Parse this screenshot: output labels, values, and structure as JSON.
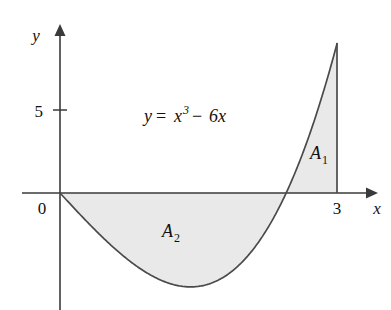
{
  "figure": {
    "equation": {
      "lhs": "y",
      "equals": "=",
      "base": "x",
      "exponent": "3",
      "minus": "−",
      "term": "6x",
      "full": "y = x³ − 6x"
    },
    "axes": {
      "x_label": "x",
      "y_label": "y",
      "x_ticks": [
        {
          "value": 3,
          "label": "3"
        }
      ],
      "y_ticks": [
        {
          "value": 5,
          "label": "5"
        }
      ],
      "origin_label": "0"
    },
    "regions": [
      {
        "id": "A1",
        "letter": "A",
        "subscript": "1"
      },
      {
        "id": "A2",
        "letter": "A",
        "subscript": "2"
      }
    ],
    "colors": {
      "shade_fill": "#e9e9e9",
      "curve_stroke": "#4a4a4a",
      "axis_stroke": "#3a3a3a",
      "text": "#111111",
      "background": "#ffffff"
    }
  },
  "chart_data": {
    "type": "line",
    "title": "",
    "xlabel": "x",
    "ylabel": "y",
    "function": "y = x^3 - 6x",
    "xlim": [
      -0.42,
      3.37
    ],
    "ylim": [
      -6.8,
      9.4
    ],
    "grid": false,
    "legend": null,
    "x_ticks": [
      3
    ],
    "y_ticks": [
      5
    ],
    "roots_shown": [
      0,
      2.449489742783178
    ],
    "local_minimum": {
      "x": 1.4142135623730951,
      "y": -5.656854249492381
    },
    "endpoint": {
      "x": 3,
      "y": 9
    },
    "annotations": [
      {
        "text": "y = x³ − 6x",
        "x": 1.35,
        "y": 5.0
      },
      {
        "text": "A₁",
        "x": 2.72,
        "y": 2.0
      },
      {
        "text": "A₂",
        "x": 1.2,
        "y": -2.4
      }
    ],
    "shaded_regions": [
      {
        "name": "A₁",
        "x_from": 2.449489742783178,
        "x_to": 3,
        "sign": "positive",
        "area": 6.25
      },
      {
        "name": "A₂",
        "x_from": 0,
        "x_to": 2.449489742783178,
        "sign": "negative",
        "area": 9.0
      }
    ],
    "series": [
      {
        "name": "y = x^3 - 6x",
        "x": [
          0,
          0.15,
          0.3,
          0.45,
          0.6,
          0.75,
          0.9,
          1.05,
          1.2,
          1.35,
          1.5,
          1.65,
          1.8,
          1.95,
          2.1,
          2.25,
          2.4,
          2.55,
          2.7,
          2.85,
          3
        ],
        "values": [
          0,
          -0.8966,
          -2.373,
          -3.609,
          -4.384,
          -4.078,
          -4.671,
          -5.142,
          -5.472,
          -5.639,
          -5.625,
          -5.408,
          -4.968,
          -4.286,
          -3.339,
          -2.109,
          -0.576,
          1.2809,
          3.483,
          6.0491,
          9
        ]
      }
    ]
  }
}
